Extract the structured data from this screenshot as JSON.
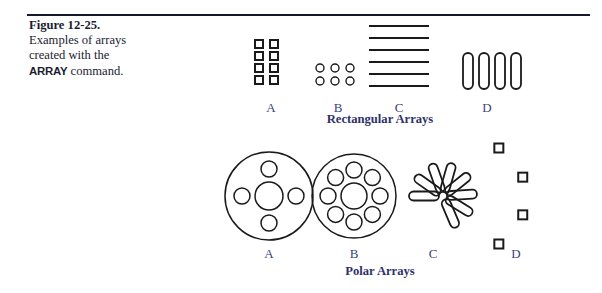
{
  "figure": {
    "number": "Figure 12-25.",
    "caption_lines": [
      "Examples of arrays",
      "created with the"
    ],
    "caption_command": "ARRAY",
    "caption_tail": " command.",
    "rule_color": "#16182e",
    "caption_color": "#1b1c33",
    "label_color": "#3b3f77",
    "title_color": "#2e3168",
    "line_color": "#1a1a1a"
  },
  "groups": [
    {
      "id": "rectangular",
      "title": "Rectangular Arrays",
      "title_x": 380,
      "title_y": 112,
      "items": [
        {
          "id": "rect-a",
          "label": "A",
          "label_x": 271,
          "label_y": 100,
          "kind": "grid-of-squares",
          "rows": 4,
          "cols": 2,
          "cell_size": 8,
          "gap_x": 15,
          "gap_y": 12,
          "origin_x": 255,
          "origin_y": 40
        },
        {
          "id": "rect-b",
          "label": "B",
          "label_x": 338,
          "label_y": 100,
          "kind": "grid-of-circles",
          "rows": 2,
          "cols": 3,
          "diameter": 8,
          "gap_x": 15,
          "gap_y": 13,
          "origin_x": 320,
          "origin_y": 68
        },
        {
          "id": "rect-c",
          "label": "C",
          "label_x": 399,
          "label_y": 100,
          "kind": "stack-of-lines",
          "count": 6,
          "length": 60,
          "gap_y": 12,
          "origin_x": 369,
          "origin_y": 26
        },
        {
          "id": "rect-d",
          "label": "D",
          "label_x": 487,
          "label_y": 100,
          "kind": "row-of-slots",
          "count": 4,
          "slot_width": 10,
          "slot_height": 36,
          "gap_x": 16,
          "origin_x": 463,
          "origin_y": 53
        }
      ]
    },
    {
      "id": "polar",
      "title": "Polar Arrays",
      "title_x": 380,
      "title_y": 264,
      "items": [
        {
          "id": "polar-a",
          "label": "A",
          "label_x": 269,
          "label_y": 246,
          "kind": "hub-with-holes",
          "center_x": 269,
          "center_y": 196,
          "outer_radius": 44,
          "center_hole_radius": 14,
          "hole_count": 4,
          "hole_radius": 8,
          "hole_orbit": 27,
          "start_angle": -90
        },
        {
          "id": "polar-b",
          "label": "B",
          "label_x": 354,
          "label_y": 246,
          "kind": "hub-with-holes",
          "center_x": 354,
          "center_y": 196,
          "outer_radius": 42,
          "center_hole_radius": 13,
          "hole_count": 8,
          "hole_radius": 8,
          "hole_orbit": 26,
          "start_angle": -90
        },
        {
          "id": "polar-c",
          "label": "C",
          "label_x": 433,
          "label_y": 246,
          "kind": "radial-slots",
          "center_x": 443,
          "center_y": 196,
          "count": 8,
          "slot_length": 30,
          "slot_width": 9,
          "inner_offset": 4,
          "start_angle": 180,
          "sweep": 247
        },
        {
          "id": "polar-d",
          "label": "D",
          "label_x": 516,
          "label_y": 246,
          "kind": "arc-of-squares",
          "center_x": 470,
          "center_y": 196,
          "count": 4,
          "square_size": 9,
          "orbit": 56,
          "start_angle": -59,
          "sweep": 118
        }
      ]
    }
  ]
}
